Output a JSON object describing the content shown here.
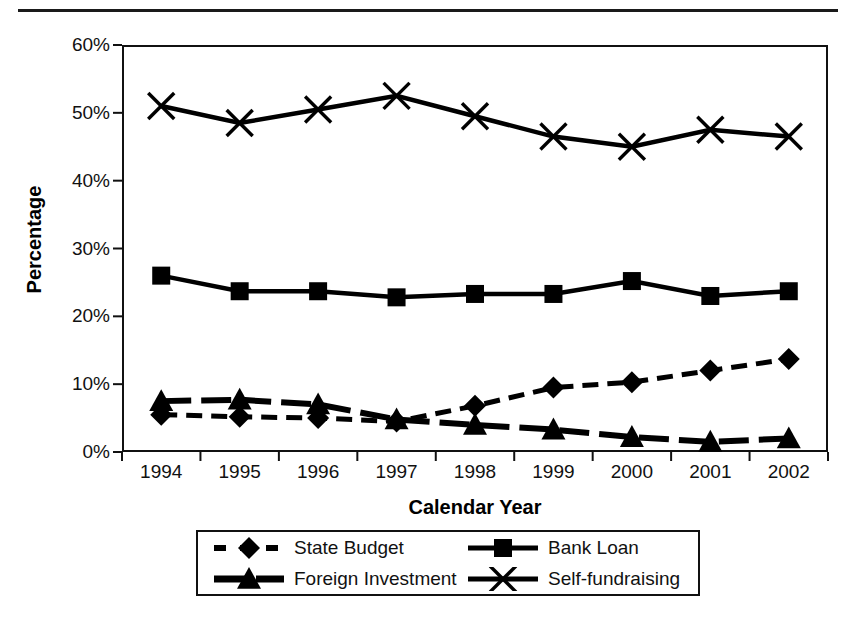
{
  "chart_data": {
    "type": "line",
    "title": "",
    "xlabel": "Calendar Year",
    "ylabel": "Percentage",
    "categories": [
      "1994",
      "1995",
      "1996",
      "1997",
      "1998",
      "1999",
      "2000",
      "2001",
      "2002"
    ],
    "ylim": [
      0,
      60
    ],
    "ytick_labels": [
      "0%",
      "10%",
      "20%",
      "30%",
      "40%",
      "50%",
      "60%"
    ],
    "ytick_values": [
      0,
      10,
      20,
      30,
      40,
      50,
      60
    ],
    "grid": false,
    "legend_position": "below-bottom-center",
    "series": [
      {
        "name": "State Budget",
        "marker": "diamond",
        "line_style": "dashed",
        "color": "#000000",
        "values": [
          5.5,
          5.2,
          5.0,
          4.5,
          6.8,
          9.5,
          10.3,
          12.0,
          13.7
        ]
      },
      {
        "name": "Bank Loan",
        "marker": "square",
        "line_style": "solid",
        "color": "#000000",
        "values": [
          26.0,
          23.7,
          23.7,
          22.8,
          23.3,
          23.3,
          25.2,
          23.0,
          23.7
        ]
      },
      {
        "name": "Foreign Investment",
        "marker": "triangle",
        "line_style": "dashed-thick",
        "color": "#000000",
        "values": [
          7.5,
          7.7,
          7.0,
          4.8,
          4.0,
          3.3,
          2.2,
          1.5,
          2.0
        ]
      },
      {
        "name": "Self-fundraising",
        "marker": "cross",
        "line_style": "solid",
        "color": "#000000",
        "values": [
          51.0,
          48.5,
          50.5,
          52.5,
          49.5,
          46.5,
          45.0,
          47.5,
          46.5
        ]
      }
    ]
  },
  "legend": {
    "entries": [
      {
        "label": "State Budget",
        "marker": "diamond",
        "line_style": "dashed"
      },
      {
        "label": "Bank Loan",
        "marker": "square",
        "line_style": "solid"
      },
      {
        "label": "Foreign Investment",
        "marker": "triangle",
        "line_style": "dashed-thick"
      },
      {
        "label": "Self-fundraising",
        "marker": "cross",
        "line_style": "solid"
      }
    ]
  },
  "colors": {
    "ink": "#000000",
    "frame": "#111111",
    "background": "#ffffff"
  }
}
